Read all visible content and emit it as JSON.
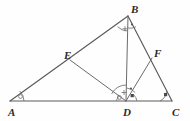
{
  "figure": {
    "type": "geometry-diagram",
    "background_color": "#fefefe",
    "stroke_color": "#5a5a5a",
    "label_color": "#2b2b2b",
    "width": 190,
    "height": 121
  },
  "points": [
    {
      "name": "A",
      "label": "A",
      "x": 10,
      "y": 101,
      "label_x": 8,
      "label_y": 114
    },
    {
      "name": "B",
      "label": "B",
      "x": 128,
      "y": 16,
      "label_x": 131,
      "label_y": 11
    },
    {
      "name": "C",
      "label": "C",
      "x": 172,
      "y": 101,
      "label_x": 172,
      "label_y": 114
    },
    {
      "name": "D",
      "label": "D",
      "x": 126,
      "y": 101,
      "label_x": 123,
      "label_y": 114
    },
    {
      "name": "E",
      "label": "E",
      "x": 70,
      "y": 60,
      "label_x": 64,
      "label_y": 57
    },
    {
      "name": "F",
      "label": "F",
      "x": 152,
      "y": 58,
      "label_x": 154,
      "label_y": 55
    }
  ],
  "segments": [
    {
      "name": "side-AB",
      "from": "A",
      "to": "B"
    },
    {
      "name": "side-BC",
      "from": "B",
      "to": "C"
    },
    {
      "name": "side-AC",
      "from": "A",
      "to": "C"
    },
    {
      "name": "cevian-BD",
      "from": "B",
      "to": "D"
    },
    {
      "name": "cevian-ED",
      "from": "E",
      "to": "D"
    },
    {
      "name": "cevian-FD",
      "from": "F",
      "to": "D"
    }
  ],
  "angle_marks": [
    {
      "name": "angle-A",
      "at": "A",
      "mark": "circle",
      "radius": 14
    },
    {
      "name": "angle-B-left",
      "at": "B",
      "mark": "plus",
      "radius": 15
    },
    {
      "name": "angle-B-right",
      "at": "B",
      "mark": "dot",
      "radius": 12
    },
    {
      "name": "angle-D-left",
      "at": "D",
      "mark": "circle",
      "radius": 10
    },
    {
      "name": "angle-D-upper",
      "at": "D",
      "mark": "plus",
      "radius": 16
    },
    {
      "name": "angle-D-mid",
      "at": "D",
      "mark": "dot",
      "radius": 13
    },
    {
      "name": "angle-D-right",
      "at": "D",
      "mark": "square",
      "radius": 11
    },
    {
      "name": "angle-C",
      "at": "C",
      "mark": "square",
      "radius": 12
    }
  ]
}
